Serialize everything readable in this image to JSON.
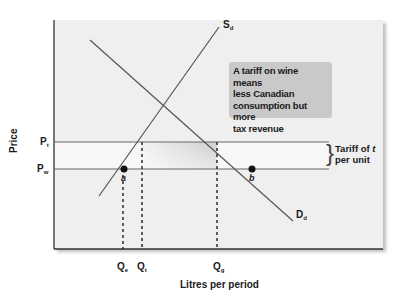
{
  "diagram": {
    "title_note": "A tariff on wine means less Canadian consumption but more tax revenue",
    "note_lines": [
      "A tariff on wine means",
      "less Canadian",
      "consumption but more",
      "tax revenue"
    ],
    "axes": {
      "y_label": "Price",
      "x_label": "Litres per period"
    },
    "price_levels": [
      {
        "id": "Pt",
        "base": "P",
        "sub": "t"
      },
      {
        "id": "Pw",
        "base": "P",
        "sub": "w"
      }
    ],
    "quantities": [
      {
        "id": "Qe",
        "base": "Q",
        "sub": "e"
      },
      {
        "id": "Qt",
        "base": "Q",
        "sub": "t"
      },
      {
        "id": "Qg",
        "base": "Q",
        "sub": "g"
      }
    ],
    "curves": [
      {
        "id": "supply",
        "base": "S",
        "sub": "d"
      },
      {
        "id": "demand",
        "base": "D",
        "sub": "d"
      }
    ],
    "points": [
      {
        "id": "a",
        "label": "a"
      },
      {
        "id": "b",
        "label": "b"
      }
    ],
    "tariff_annotation": {
      "line1_prefix": "Tariff of ",
      "line1_var": "t",
      "line2": "per unit"
    },
    "colors": {
      "panel_bg": "#efefef",
      "curve": "#555555",
      "axis": "#333333",
      "note_bg": "#c9c9c9",
      "shaded_area": "#d6d6d6"
    }
  }
}
